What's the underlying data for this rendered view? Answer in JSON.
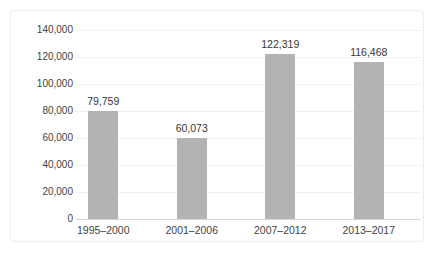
{
  "chart_data": {
    "type": "bar",
    "categories": [
      "1995–2000",
      "2001–2006",
      "2007–2012",
      "2013–2017"
    ],
    "values": [
      79759,
      60073,
      122319,
      116468
    ],
    "value_labels": [
      "79,759",
      "60,073",
      "122,319",
      "116,468"
    ],
    "title": "",
    "xlabel": "",
    "ylabel": "",
    "ylim": [
      0,
      140000
    ],
    "ytick_interval": 20000,
    "ytick_labels": [
      "0",
      "20,000",
      "40,000",
      "60,000",
      "80,000",
      "100,000",
      "120,000",
      "140,000"
    ],
    "grid": true,
    "legend_position": "none",
    "bar_color": "#b3b3b3",
    "gridline_color": "#f0f0f0",
    "axis_line_color": "#d6d6d6",
    "label_color": "#3f3f3f",
    "card_border_color": "#ededed"
  }
}
